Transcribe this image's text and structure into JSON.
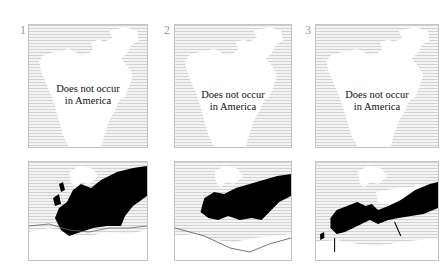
{
  "figure": {
    "panels": [
      {
        "number": "1",
        "america_map": {
          "label_line1": "Does not occur",
          "label_line2": "in America"
        },
        "europe_map": {
          "range": "extensive range covering most of Europe and extending east into Asia",
          "has_boundary_line": true
        }
      },
      {
        "number": "2",
        "america_map": {
          "label_line1": "Does not occur",
          "label_line2": "in America"
        },
        "europe_map": {
          "range": "central and eastern Europe band extending east",
          "has_boundary_line": true
        }
      },
      {
        "number": "3",
        "america_map": {
          "label_line1": "Does not occur",
          "label_line2": "in America"
        },
        "europe_map": {
          "range": "southern Europe from Iberia across to Asia",
          "has_boundary_line": false
        }
      }
    ],
    "colors": {
      "range_fill": "#000000",
      "land": "#ffffff",
      "sea_hatch": "#d2d2d2",
      "border": "#c4c4c4"
    }
  }
}
